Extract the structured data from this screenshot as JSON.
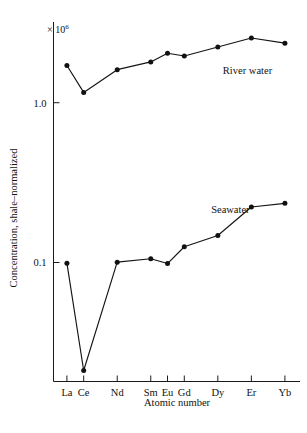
{
  "chart_data": {
    "type": "line",
    "title": "",
    "subtitle": "",
    "xlabel": "Atomic number",
    "ylabel": "Concentration, shale–normalized",
    "scale_note": "× 10",
    "scale_note_exponent": "6",
    "yscale": "log",
    "ylim": [
      0.018,
      3.2
    ],
    "y_ticks": [
      {
        "value": 1.0,
        "label": "1.0"
      },
      {
        "value": 0.1,
        "label": "0.1"
      }
    ],
    "x": [
      57,
      58,
      60,
      62,
      63,
      64,
      66,
      68,
      70
    ],
    "categories": [
      "La",
      "Ce",
      "Nd",
      "Sm",
      "Eu",
      "Gd",
      "Dy",
      "Er",
      "Yb"
    ],
    "xlim": [
      56.2,
      70.9
    ],
    "grid": false,
    "legend": "inline-annotations",
    "series": [
      {
        "name": "River water",
        "label": "River water",
        "label_x": 66.3,
        "label_y": 1.52,
        "color": "#111111",
        "marker": "filled-circle",
        "values": [
          1.71,
          1.16,
          1.61,
          1.8,
          2.04,
          1.96,
          2.23,
          2.54,
          2.36
        ]
      },
      {
        "name": "Seawater",
        "label": "Seawater",
        "label_x": 65.6,
        "label_y": 0.205,
        "color": "#111111",
        "marker": "filled-circle",
        "values": [
          0.099,
          0.0211,
          0.1005,
          0.1055,
          0.0985,
          0.1255,
          0.1475,
          0.2225,
          0.2345
        ]
      }
    ]
  }
}
